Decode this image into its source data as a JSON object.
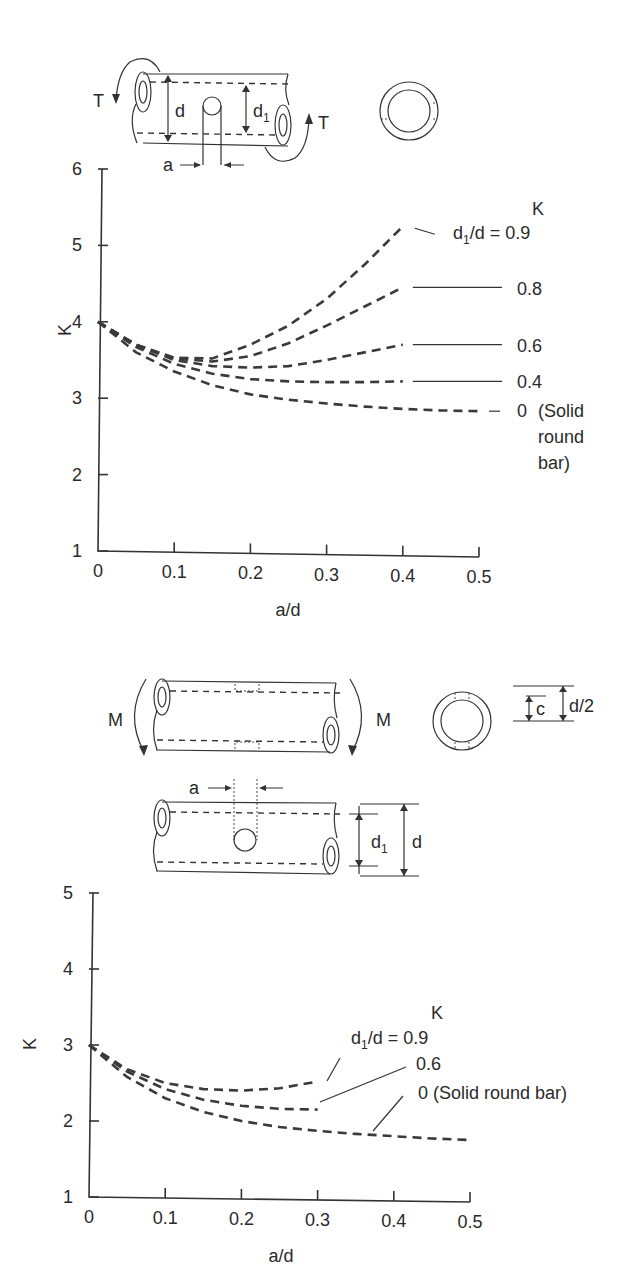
{
  "torsion_figure": {
    "torque_label": "T",
    "outer_dim_label": "d",
    "inner_dim_label": "d",
    "inner_dim_sub": "1",
    "hole_dim_label": "a"
  },
  "bending_figure": {
    "moment_label": "M",
    "hole_dim_label": "a",
    "inner_dim_label": "d",
    "inner_dim_sub": "1",
    "outer_dim_label": "d",
    "c_label": "c",
    "half_d_label": "d/2"
  },
  "chart_data": [
    {
      "type": "line",
      "title": "Torsion: tube with transverse hole",
      "xlabel": "a/d",
      "ylabel": "K",
      "xlim": [
        0,
        0.5
      ],
      "ylim": [
        1,
        6
      ],
      "xticks": [
        "0",
        "0.1",
        "0.2",
        "0.3",
        "0.4",
        "0.5"
      ],
      "yticks": [
        "1",
        "2",
        "3",
        "4",
        "5",
        "6"
      ],
      "grid": false,
      "legend_title": "K",
      "legend_prefix": "d",
      "legend_prefix_sub": "1",
      "legend_prefix_tail": "/d = ",
      "series": [
        {
          "name": "0.9",
          "label": "0.9",
          "x": [
            0,
            0.05,
            0.1,
            0.15,
            0.2,
            0.25,
            0.3,
            0.35,
            0.4
          ],
          "values": [
            4.0,
            3.7,
            3.53,
            3.52,
            3.7,
            3.95,
            4.3,
            4.75,
            5.25
          ]
        },
        {
          "name": "0.8",
          "label": "0.8",
          "x": [
            0,
            0.05,
            0.1,
            0.15,
            0.2,
            0.25,
            0.3,
            0.35,
            0.4
          ],
          "values": [
            4.0,
            3.7,
            3.52,
            3.48,
            3.55,
            3.72,
            3.95,
            4.2,
            4.45
          ]
        },
        {
          "name": "0.6",
          "label": "0.6",
          "x": [
            0,
            0.05,
            0.1,
            0.15,
            0.2,
            0.25,
            0.3,
            0.35,
            0.4
          ],
          "values": [
            4.0,
            3.7,
            3.5,
            3.42,
            3.4,
            3.42,
            3.5,
            3.6,
            3.7
          ]
        },
        {
          "name": "0.4",
          "label": "0.4",
          "x": [
            0,
            0.05,
            0.1,
            0.15,
            0.2,
            0.25,
            0.3,
            0.35,
            0.4
          ],
          "values": [
            4.0,
            3.67,
            3.45,
            3.32,
            3.25,
            3.22,
            3.21,
            3.21,
            3.22
          ]
        },
        {
          "name": "0 (Solid round bar)",
          "label": "0",
          "label_extra": [
            "(Solid",
            "round",
            "bar)"
          ],
          "x": [
            0,
            0.05,
            0.1,
            0.15,
            0.2,
            0.25,
            0.3,
            0.35,
            0.4,
            0.45,
            0.5
          ],
          "values": [
            4.0,
            3.6,
            3.35,
            3.17,
            3.05,
            2.98,
            2.93,
            2.89,
            2.86,
            2.84,
            2.83
          ]
        }
      ]
    },
    {
      "type": "line",
      "title": "Bending: tube with transverse hole",
      "xlabel": "a/d",
      "ylabel": "K",
      "xlim": [
        0,
        0.5
      ],
      "ylim": [
        1,
        5
      ],
      "xticks": [
        "0",
        "0.1",
        "0.2",
        "0.3",
        "0.4",
        "0.5"
      ],
      "yticks": [
        "1",
        "2",
        "3",
        "4",
        "5"
      ],
      "grid": false,
      "legend_title": "K",
      "legend_prefix": "d",
      "legend_prefix_sub": "1",
      "legend_prefix_tail": "/d = ",
      "series": [
        {
          "name": "0.9",
          "label": "0.9",
          "x": [
            0,
            0.05,
            0.1,
            0.15,
            0.2,
            0.25,
            0.3
          ],
          "values": [
            3.0,
            2.68,
            2.5,
            2.42,
            2.4,
            2.43,
            2.52
          ]
        },
        {
          "name": "0.6",
          "label": "0.6",
          "x": [
            0,
            0.05,
            0.1,
            0.15,
            0.2,
            0.25,
            0.3
          ],
          "values": [
            3.0,
            2.65,
            2.42,
            2.28,
            2.2,
            2.16,
            2.15
          ]
        },
        {
          "name": "0 (Solid round bar)",
          "label": "0 (Solid round bar)",
          "x": [
            0,
            0.05,
            0.1,
            0.15,
            0.2,
            0.25,
            0.3,
            0.35,
            0.4,
            0.45,
            0.5
          ],
          "values": [
            3.0,
            2.58,
            2.3,
            2.12,
            2.0,
            1.92,
            1.87,
            1.83,
            1.8,
            1.77,
            1.75
          ]
        }
      ]
    }
  ]
}
